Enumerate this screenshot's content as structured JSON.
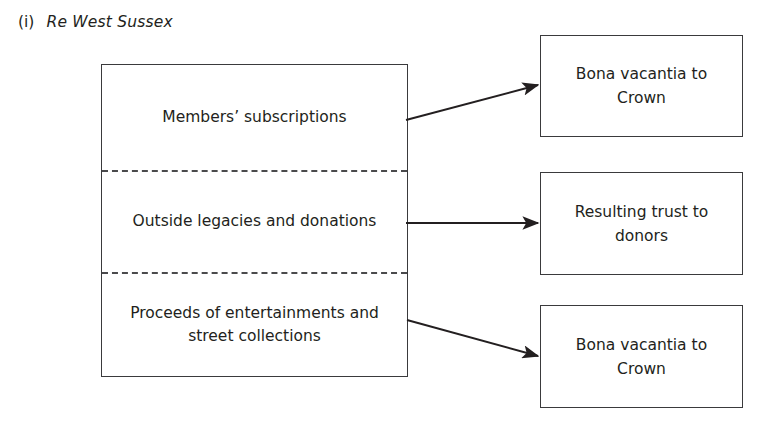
{
  "caption": {
    "marker": "(i)",
    "case_name": "Re West Sussex"
  },
  "diagram": {
    "type": "flow",
    "title": "Re West Sussex",
    "source_box": {
      "name": "fund-sources",
      "cells": [
        {
          "id": "members-subscriptions",
          "text": "Members’ subscriptions"
        },
        {
          "id": "outside-legacies",
          "text": "Outside legacies and donations"
        },
        {
          "id": "proceeds-entertainments",
          "text": "Proceeds of entertainments and street collections"
        }
      ],
      "divider_style": "dashed"
    },
    "outcome_boxes": [
      {
        "id": "bona-vacantia-1",
        "text": "Bona vacantia to Crown"
      },
      {
        "id": "resulting-trust",
        "text": "Resulting trust to donors"
      },
      {
        "id": "bona-vacantia-2",
        "text": "Bona vacantia to Crown"
      }
    ],
    "connections": [
      {
        "from": "members-subscriptions",
        "to": "bona-vacantia-1",
        "style": "solid-arrow"
      },
      {
        "from": "outside-legacies",
        "to": "resulting-trust",
        "style": "solid-arrow"
      },
      {
        "from": "proceeds-entertainments",
        "to": "bona-vacantia-2",
        "style": "solid-arrow"
      }
    ],
    "colors": {
      "ink": "#231f20",
      "stroke": "#3a3a3c",
      "background": "#ffffff"
    }
  }
}
